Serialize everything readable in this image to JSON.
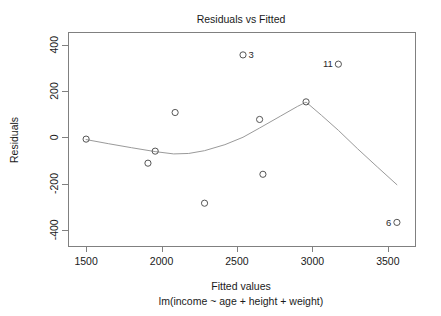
{
  "chart_data": {
    "type": "scatter",
    "title": "Residuals vs Fitted",
    "xlabel": "Fitted values",
    "sublabel": "lm(income ~ age + height + weight)",
    "ylabel": "Residuals",
    "xlim": [
      1380,
      3680
    ],
    "ylim": [
      -470,
      455
    ],
    "xticks": [
      1500,
      2000,
      2500,
      3000,
      3500
    ],
    "xticklabels": [
      "1500",
      "2000",
      "2500",
      "3000",
      "3500"
    ],
    "yticks": [
      -400,
      -200,
      0,
      200,
      400
    ],
    "yticklabels": [
      "-400",
      "-200",
      "0",
      "200",
      "400"
    ],
    "grid": false,
    "legend": null,
    "point_color": "#555555",
    "curve_color": "#9a9a9a",
    "axis_color": "#808080",
    "points": [
      {
        "x": 1500,
        "y": -8,
        "label": "",
        "label_side": ""
      },
      {
        "x": 1910,
        "y": -112,
        "label": "",
        "label_side": ""
      },
      {
        "x": 1958,
        "y": -60,
        "label": "",
        "label_side": ""
      },
      {
        "x": 2090,
        "y": 107,
        "label": "",
        "label_side": ""
      },
      {
        "x": 2285,
        "y": -285,
        "label": "",
        "label_side": ""
      },
      {
        "x": 2540,
        "y": 356,
        "label": "3",
        "label_side": "right"
      },
      {
        "x": 2650,
        "y": 77,
        "label": "",
        "label_side": ""
      },
      {
        "x": 2672,
        "y": -160,
        "label": "",
        "label_side": ""
      },
      {
        "x": 2958,
        "y": 153,
        "label": "",
        "label_side": ""
      },
      {
        "x": 3172,
        "y": 316,
        "label": "11",
        "label_side": "left"
      },
      {
        "x": 3560,
        "y": -368,
        "label": "6",
        "label_side": "left"
      }
    ],
    "smooth_curve": [
      {
        "x": 1500,
        "y": -10
      },
      {
        "x": 1650,
        "y": -28
      },
      {
        "x": 1800,
        "y": -45
      },
      {
        "x": 1958,
        "y": -62
      },
      {
        "x": 2080,
        "y": -72
      },
      {
        "x": 2180,
        "y": -70
      },
      {
        "x": 2285,
        "y": -58
      },
      {
        "x": 2420,
        "y": -32
      },
      {
        "x": 2540,
        "y": 0
      },
      {
        "x": 2650,
        "y": 40
      },
      {
        "x": 2790,
        "y": 92
      },
      {
        "x": 2900,
        "y": 133
      },
      {
        "x": 2958,
        "y": 152
      },
      {
        "x": 3060,
        "y": 95
      },
      {
        "x": 3172,
        "y": 30
      },
      {
        "x": 3300,
        "y": -50
      },
      {
        "x": 3430,
        "y": -128
      },
      {
        "x": 3560,
        "y": -205
      }
    ]
  }
}
